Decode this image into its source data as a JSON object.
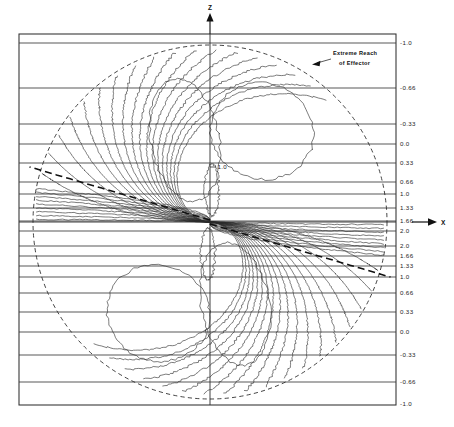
{
  "figure": {
    "title": "",
    "axes": {
      "vertical_axis_label": "Z",
      "horizontal_axis_label": "X",
      "vertical_axis_name": "vertical-axis-z",
      "horizontal_axis_name": "horizontal-axis-x"
    },
    "annotation": {
      "line1": "Extreme Reach",
      "line2": "of Effector",
      "target": "reach-circle"
    },
    "inline_contour_label": "1.0",
    "plot_frame": {
      "left": 19,
      "top": 34,
      "right": 396,
      "bottom": 405
    },
    "reach_circle": {
      "cx": 210,
      "cy": 222,
      "r": 177
    },
    "singularity": {
      "x": 210,
      "y": 222
    }
  },
  "chart_data": {
    "type": "line",
    "subtype": "contour-field",
    "title": "",
    "xlabel": "X",
    "ylabel": "Z",
    "grid": true,
    "legend": false,
    "axis_tick_labels_right": [
      {
        "value": "-1.0",
        "y": 43
      },
      {
        "value": "-0.66",
        "y": 88
      },
      {
        "value": "-0.33",
        "y": 124
      },
      {
        "value": "0.0",
        "y": 144
      },
      {
        "value": "0.33",
        "y": 163
      },
      {
        "value": "0.66",
        "y": 182
      },
      {
        "value": "1.0",
        "y": 194
      },
      {
        "value": "1.33",
        "y": 208
      },
      {
        "value": "1.66",
        "y": 221
      },
      {
        "value": "2.0",
        "y": 231
      },
      {
        "value": "2.0",
        "y": 246
      },
      {
        "value": "1.66",
        "y": 256
      },
      {
        "value": "1.33",
        "y": 266
      },
      {
        "value": "1.0",
        "y": 277
      },
      {
        "value": "0.66",
        "y": 293
      },
      {
        "value": "0.33",
        "y": 312
      },
      {
        "value": "0.0",
        "y": 332
      },
      {
        "value": "-0.33",
        "y": 355
      },
      {
        "value": "-0.66",
        "y": 382
      },
      {
        "value": "-1.0",
        "y": 404
      }
    ],
    "gridlines_y": [
      43,
      88,
      124,
      144,
      163,
      182,
      194,
      208,
      221,
      231,
      246,
      256,
      266,
      277,
      293,
      312,
      332,
      355,
      382
    ],
    "contour_levels_upper": [
      -1.0,
      -0.66,
      -0.33,
      0.0,
      0.33,
      0.66,
      1.0,
      1.33,
      1.66,
      2.0
    ],
    "contour_levels_lower": [
      2.0,
      1.66,
      1.33,
      1.0,
      0.66,
      0.33,
      0.0,
      -0.33,
      -0.66,
      -1.0
    ],
    "ylim": [
      -1.0,
      2.0
    ],
    "symmetry": "180-degree rotational about singularity",
    "reach_radius_label": "Extreme Reach of Effector"
  }
}
